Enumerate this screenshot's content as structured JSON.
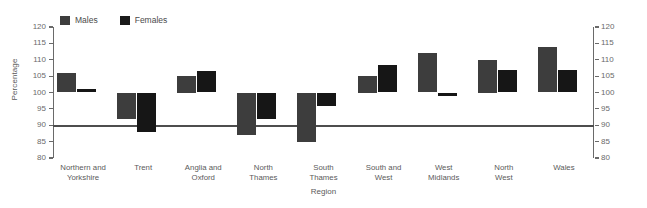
{
  "chart_data": {
    "type": "bar",
    "title": "",
    "xlabel": "Region",
    "ylabel": "Percentage",
    "ylim": [
      80,
      120
    ],
    "yticks": [
      80,
      85,
      90,
      95,
      100,
      105,
      110,
      115,
      120
    ],
    "baseline": 100,
    "grid": false,
    "legend_position": "top-left",
    "dual_y_axis": true,
    "categories": [
      "Northern and\nYorkshire",
      "Trent",
      "Anglia and\nOxford",
      "North\nThames",
      "South\nThames",
      "South and\nWest",
      "West\nMidlands",
      "North\nWest",
      "Wales"
    ],
    "series": [
      {
        "name": "Males",
        "color": "#3d3d3d",
        "values": [
          106,
          92,
          105,
          87,
          85,
          105,
          112,
          110,
          114
        ]
      },
      {
        "name": "Females",
        "color": "#161616",
        "values": [
          101,
          88,
          106.5,
          92,
          96,
          108.5,
          99,
          107,
          107
        ]
      }
    ]
  },
  "legend": {
    "males_label": "Males",
    "females_label": "Females"
  },
  "axis": {
    "y_title": "Percentage",
    "x_title": "Region",
    "tick_labels": [
      "120",
      "115",
      "110",
      "105",
      "100",
      "95",
      "90",
      "85",
      "80"
    ]
  }
}
